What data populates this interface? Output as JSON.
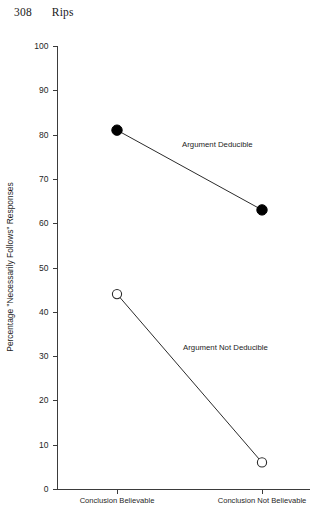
{
  "running_head": {
    "page_number": "308",
    "title": "Rips"
  },
  "chart_data": {
    "type": "line",
    "title": "",
    "xlabel": "",
    "ylabel": "Percentage \"Necessarily Follows\" Responses",
    "categories": [
      "Conclusion Believable",
      "Conclusion Not Believable"
    ],
    "ylim": [
      0,
      100
    ],
    "yticks": [
      0,
      10,
      20,
      30,
      40,
      50,
      60,
      70,
      80,
      90,
      100
    ],
    "ytick_labels": [
      "0",
      "10",
      "20",
      "30",
      "40",
      "50",
      "60",
      "70",
      "80",
      "90",
      "100"
    ],
    "grid": false,
    "legend_position": "inline-annotation",
    "series": [
      {
        "name": "Argument Deducible",
        "values": [
          81,
          63
        ],
        "marker": "filled-circle",
        "annotation": "Argument Deducible"
      },
      {
        "name": "Argument Not Deducible",
        "values": [
          44,
          6
        ],
        "marker": "open-circle",
        "annotation": "Argument Not Deducible"
      }
    ],
    "colors": {
      "line": "#2b2b2b",
      "marker_filled": "#000000",
      "marker_open_fill": "#ffffff",
      "axis": "#3b3b3b"
    }
  }
}
